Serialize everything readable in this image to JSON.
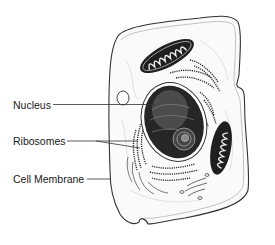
{
  "diagram": {
    "labels": [
      {
        "id": "nucleus",
        "text": "Nucleus",
        "x": 13,
        "y": 99
      },
      {
        "id": "ribosomes",
        "text": "Ribosomes",
        "x": 13,
        "y": 136
      },
      {
        "id": "cell-membrane",
        "text": "Cell Membrane",
        "x": 13,
        "y": 174
      }
    ]
  },
  "colors": {
    "ink": "#1a1a1a",
    "fill": "#f4f4f4",
    "organelle_dark": "#222222"
  }
}
